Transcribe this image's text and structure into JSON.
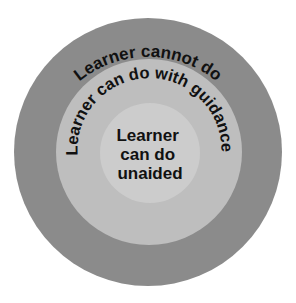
{
  "diagram": {
    "type": "concentric-circles",
    "rings": [
      {
        "id": "outer",
        "label": "Learner cannot do",
        "color": "#8b8b8b",
        "center": [
          148,
          152
        ],
        "radius": 134
      },
      {
        "id": "middle",
        "label": "Learner can do with guidance",
        "color": "#bebebe",
        "center": [
          149,
          152
        ],
        "radius": 93
      },
      {
        "id": "inner",
        "label_lines": [
          "Learner",
          "can do",
          "unaided"
        ],
        "color": "#cccccc",
        "center": [
          150,
          153
        ],
        "radius": 50
      }
    ]
  }
}
